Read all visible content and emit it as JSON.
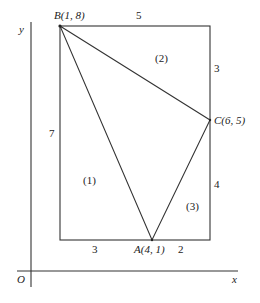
{
  "diagram": {
    "type": "geometry",
    "axes": {
      "origin_label": "O",
      "x_label": "x",
      "y_label": "y"
    },
    "points": {
      "A": {
        "label": "A(4, 1)",
        "name": "A",
        "coords": [
          4,
          1
        ]
      },
      "B": {
        "label": "B(1, 8)",
        "name": "B",
        "coords": [
          1,
          8
        ]
      },
      "C": {
        "label": "C(6, 5)",
        "name": "C",
        "coords": [
          6,
          5
        ]
      }
    },
    "dimensions": {
      "top": "5",
      "right_upper": "3",
      "right_lower": "4",
      "left": "7",
      "bottom_left": "3",
      "bottom_right": "2"
    },
    "regions": {
      "r1": "(1)",
      "r2": "(2)",
      "r3": "(3)"
    }
  }
}
